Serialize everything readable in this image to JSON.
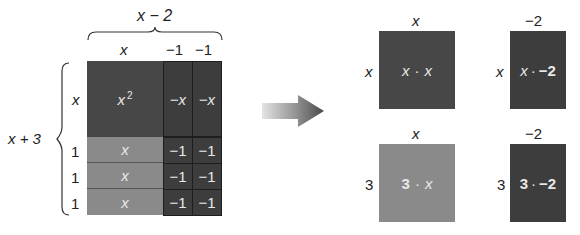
{
  "left_model": {
    "top_label": "x − 2",
    "col_labels": [
      "x",
      "−1",
      "−1"
    ],
    "side_label": "x + 3",
    "row_labels": [
      "x",
      "1",
      "1",
      "1"
    ],
    "tiles": {
      "x_squared": "x",
      "x_squared_exp": "2",
      "neg_x": [
        "−x",
        "−x"
      ],
      "x_row": [
        "x",
        "x",
        "x"
      ],
      "neg_one": [
        "−1",
        "−1",
        "−1",
        "−1",
        "−1",
        "−1"
      ]
    }
  },
  "arrow": {
    "direction": "right",
    "icon": "arrow-right-icon"
  },
  "right_model": {
    "products": [
      {
        "top": "x",
        "side": "x",
        "text_a": "x",
        "dot": "·",
        "text_b": "x"
      },
      {
        "top": "−2",
        "side": "x",
        "text_a": "x",
        "dot": "·",
        "text_b": "−2"
      },
      {
        "top": "x",
        "side": "3",
        "text_a": "3",
        "dot": "·",
        "text_b": "x"
      },
      {
        "top": "−2",
        "side": "3",
        "text_a": "3",
        "dot": "·",
        "text_b": "−2"
      }
    ]
  },
  "colors": {
    "dark_tile": "#474747",
    "mid_tile": "#8a8a8a",
    "border": "#1e1e1e"
  }
}
